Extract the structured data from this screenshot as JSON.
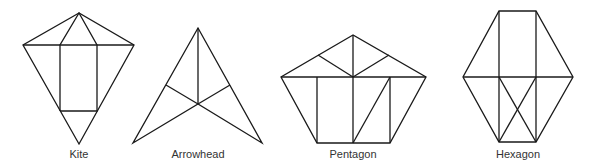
{
  "figure": {
    "shapes": [
      {
        "name": "kite",
        "label": "Kite",
        "label_x": 79
      },
      {
        "name": "arrowhead",
        "label": "Arrowhead",
        "label_x": 198
      },
      {
        "name": "pentagon",
        "label": "Pentagon",
        "label_x": 353
      },
      {
        "name": "hexagon",
        "label": "Hexagon",
        "label_x": 518
      }
    ],
    "stroke_color": "#1a1a1a",
    "background": "#ffffff"
  }
}
